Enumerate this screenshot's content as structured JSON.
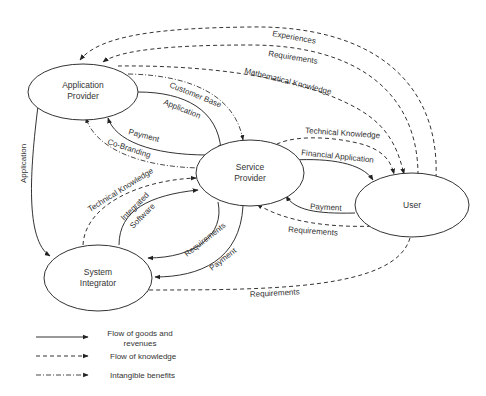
{
  "nodes": {
    "application_provider": {
      "line1": "Application",
      "line2": "Provider"
    },
    "service_provider": {
      "line1": "Service",
      "line2": "Provider"
    },
    "user": {
      "line1": "User"
    },
    "system_integrator": {
      "line1": "System",
      "line2": "Integrator"
    }
  },
  "edges": {
    "experiences": {
      "label": "Experiences",
      "from": "User",
      "to": "Application Provider",
      "type": "knowledge"
    },
    "requirements_user_ap": {
      "label": "Requirements",
      "from": "User",
      "to": "Application Provider",
      "type": "knowledge"
    },
    "mathematical_knowledge": {
      "label": "Mathematical Knowledge",
      "from": "Application Provider",
      "to": "User",
      "type": "knowledge"
    },
    "customer_base": {
      "label": "Customer Base",
      "from": "Application Provider",
      "to": "Service Provider",
      "type": "intangible"
    },
    "application_ap_sp": {
      "label": "Application",
      "from": "Application Provider",
      "to": "Service Provider",
      "type": "goods"
    },
    "payment_sp_ap": {
      "label": "Payment",
      "from": "Service Provider",
      "to": "Application Provider",
      "type": "goods"
    },
    "co_branding": {
      "label": "Co-Branding",
      "from": "Service Provider",
      "to": "Application Provider",
      "type": "intangible"
    },
    "application_ap_si": {
      "label": "Application",
      "from": "Application Provider",
      "to": "System Integrator",
      "type": "goods"
    },
    "technical_knowledge_sp_user": {
      "label": "Technical Knowledge",
      "from": "Service Provider",
      "to": "User",
      "type": "knowledge"
    },
    "financial_application": {
      "label": "Financial Application",
      "from": "Service Provider",
      "to": "User",
      "type": "goods"
    },
    "payment_user_sp": {
      "label": "Payment",
      "from": "User",
      "to": "Service Provider",
      "type": "goods"
    },
    "requirements_user_sp": {
      "label": "Requirements",
      "from": "User",
      "to": "Service Provider",
      "type": "knowledge"
    },
    "technical_knowledge_si_sp": {
      "label": "Technical Knowledge",
      "from": "System Integrator",
      "to": "Service Provider",
      "type": "knowledge"
    },
    "integrated_software": {
      "label1": "Integrated",
      "label2": "Software",
      "from": "System Integrator",
      "to": "Service Provider",
      "type": "goods"
    },
    "requirements_sp_si": {
      "label": "Requirements",
      "from": "Service Provider",
      "to": "System Integrator",
      "type": "goods"
    },
    "payment_sp_si": {
      "label": "Payment",
      "from": "Service Provider",
      "to": "System Integrator",
      "type": "goods"
    },
    "requirements_user_si": {
      "label": "Requirements",
      "from": "User",
      "to": "System Integrator",
      "type": "knowledge"
    }
  },
  "legend": {
    "goods": {
      "line1": "Flow of goods and",
      "line2": "revenues"
    },
    "knowledge": {
      "line1": "Flow of knowledge"
    },
    "intangible": {
      "line1": "Intangible benefits"
    }
  }
}
